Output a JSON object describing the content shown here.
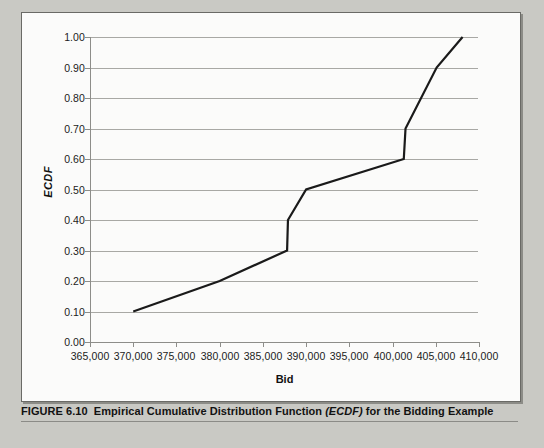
{
  "figure": {
    "caption_prefix": "FIGURE 6.10",
    "caption_main": "Empirical Cumulative Distribution Function",
    "caption_em": "(ECDF)",
    "caption_suffix": "for the Bidding Example",
    "caption_full": "FIGURE 6.10  Empirical Cumulative Distribution Function (ECDF) for the Bidding Example"
  },
  "colors": {
    "page_background": "#c9c9c4",
    "panel_background": "#fbfbfa",
    "panel_border": "#6a6a66",
    "gridline": "#a8a8a4",
    "axis": "#8d8d89",
    "series": "#1a1a1a",
    "text": "#111111"
  },
  "chart_data": {
    "type": "line",
    "title": "",
    "subtitle": "",
    "xlabel": "Bid",
    "ylabel": "ECDF",
    "xlim": [
      365000,
      410000
    ],
    "ylim": [
      0.0,
      1.0
    ],
    "xticks": [
      365000,
      370000,
      375000,
      380000,
      385000,
      390000,
      395000,
      400000,
      405000,
      410000
    ],
    "xtick_labels": [
      "365,000",
      "370,000",
      "375,000",
      "380,000",
      "385,000",
      "390,000",
      "395,000",
      "400,000",
      "405,000",
      "410,000"
    ],
    "yticks": [
      0.0,
      0.1,
      0.2,
      0.3,
      0.4,
      0.5,
      0.6,
      0.7,
      0.8,
      0.9,
      1.0
    ],
    "ytick_labels": [
      "0.00",
      "0.10",
      "0.20",
      "0.30",
      "0.40",
      "0.50",
      "0.60",
      "0.70",
      "0.80",
      "0.90",
      "1.00"
    ],
    "grid": "horizontal",
    "legend": "none",
    "series": [
      {
        "name": "ECDF",
        "color": "#1a1a1a",
        "line_width": 2.2,
        "x": [
          370000,
          380000,
          387800,
          387900,
          390000,
          401300,
          401500,
          405100,
          408100
        ],
        "y": [
          0.1,
          0.2,
          0.3,
          0.4,
          0.5,
          0.6,
          0.7,
          0.9,
          1.0
        ]
      }
    ],
    "annotations": []
  }
}
